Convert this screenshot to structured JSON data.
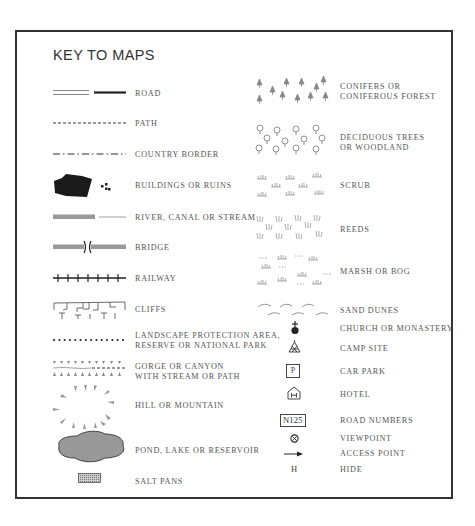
{
  "title": "KEY TO MAPS",
  "left_column": [
    {
      "icon": "road-icon",
      "label": "ROAD"
    },
    {
      "icon": "path-icon",
      "label": "PATH"
    },
    {
      "icon": "country-border-icon",
      "label": "COUNTRY BORDER"
    },
    {
      "icon": "buildings-icon",
      "label": "BUILDINGS OR RUINS"
    },
    {
      "icon": "river-icon",
      "label": "RIVER, CANAL OR STREAM"
    },
    {
      "icon": "bridge-icon",
      "label": "BRIDGE"
    },
    {
      "icon": "railway-icon",
      "label": "RAILWAY"
    },
    {
      "icon": "cliffs-icon",
      "label": "CLIFFS"
    },
    {
      "icon": "protected-area-icon",
      "label_line1": "LANDSCAPE PROTECTION AREA,",
      "label_line2": "RESERVE OR NATIONAL PARK"
    },
    {
      "icon": "gorge-icon",
      "label_line1": "GORGE OR CANYON",
      "label_line2": "WITH STREAM OR PATH"
    },
    {
      "icon": "hill-icon",
      "label": "HILL OR MOUNTAIN"
    },
    {
      "icon": "lake-icon",
      "label": "POND, LAKE OR RESERVOIR"
    },
    {
      "icon": "salt-pans-icon",
      "label": "SALT PANS"
    }
  ],
  "right_column": [
    {
      "icon": "conifer-icon",
      "label_line1": "CONIFERS OR",
      "label_line2": "CONIFEROUS FOREST"
    },
    {
      "icon": "deciduous-icon",
      "label_line1": "DECIDUOUS TREES",
      "label_line2": "OR WOODLAND"
    },
    {
      "icon": "scrub-icon",
      "label": "SCRUB"
    },
    {
      "icon": "reeds-icon",
      "label": "REEDS"
    },
    {
      "icon": "marsh-icon",
      "label": "MARSH OR BOG"
    },
    {
      "icon": "sand-dunes-icon",
      "label": "SAND DUNES"
    },
    {
      "icon": "church-icon",
      "label": "CHURCH OR MONASTERY"
    },
    {
      "icon": "camp-site-icon",
      "label": "CAMP SITE"
    },
    {
      "icon": "car-park-icon",
      "label": "CAR PARK",
      "glyph": "P"
    },
    {
      "icon": "hotel-icon",
      "label": "HOTEL",
      "glyph": "H"
    },
    {
      "icon": "road-number-icon",
      "label": "ROAD NUMBERS",
      "glyph": "N125"
    },
    {
      "icon": "viewpoint-icon",
      "label": "VIEWPOINT"
    },
    {
      "icon": "access-point-icon",
      "label": "ACCESS POINT"
    },
    {
      "icon": "hide-icon",
      "label": "HIDE",
      "glyph": "H"
    }
  ],
  "colors": {
    "border": "#333333",
    "ink": "#222222",
    "text": "#555555",
    "water": "#999999",
    "vegetation": "#999999"
  }
}
